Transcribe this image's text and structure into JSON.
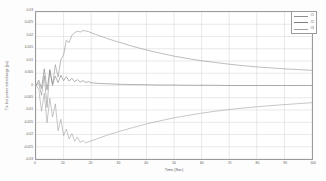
{
  "chart_data": {
    "type": "line",
    "title": "",
    "xlabel": "Time (Sec)",
    "ylabel": "Tie line power interchange (pu)",
    "xlim": [
      0,
      100
    ],
    "ylim": [
      -0.03,
      0.03
    ],
    "grid": true,
    "legend_position": "top-right",
    "xticks": [
      0,
      10,
      20,
      30,
      40,
      50,
      60,
      70,
      80,
      90,
      100
    ],
    "xtick_labels": [
      "0",
      "10",
      "20",
      "30",
      "40",
      "50",
      "60",
      "70",
      "80",
      "90",
      "100"
    ],
    "yticks": [
      -0.03,
      -0.025,
      -0.02,
      -0.015,
      -0.01,
      -0.005,
      0,
      0.005,
      0.01,
      0.015,
      0.02,
      0.025,
      0.03
    ],
    "ytick_labels": [
      "-0.03",
      "-0.025",
      "-0.02",
      "-0.015",
      "-0.01",
      "-0.005",
      "0",
      "0.005",
      "0.01",
      "0.015",
      "0.02",
      "0.025",
      "0.03"
    ],
    "x": [
      0,
      1,
      2,
      3,
      4,
      5,
      6,
      7,
      8,
      9,
      10,
      11,
      12,
      13,
      14,
      15,
      16,
      17,
      18,
      19,
      20,
      22,
      24,
      26,
      28,
      30,
      35,
      40,
      45,
      50,
      55,
      60,
      65,
      70,
      75,
      80,
      85,
      90,
      95,
      100
    ],
    "series": [
      {
        "name": "#1",
        "color": "#8f8f8f",
        "values": [
          0.0,
          0.001,
          -0.004,
          0.004,
          -0.009,
          0.0065,
          0.0,
          0.0085,
          0.0035,
          0.0105,
          0.0125,
          0.0185,
          0.0175,
          0.0205,
          0.0215,
          0.0222,
          0.0218,
          0.0224,
          0.0223,
          0.022,
          0.0215,
          0.0207,
          0.0199,
          0.0191,
          0.0184,
          0.0177,
          0.016,
          0.0145,
          0.0132,
          0.012,
          0.011,
          0.0101,
          0.0094,
          0.0087,
          0.0081,
          0.0076,
          0.0072,
          0.0068,
          0.0065,
          0.0062
        ]
      },
      {
        "name": "#2",
        "color": "#7d7d7d",
        "values": [
          0.0,
          0.0022,
          -0.0012,
          0.0068,
          -0.0018,
          0.0062,
          0.0005,
          0.0038,
          0.0012,
          0.0042,
          0.002,
          0.0036,
          0.0018,
          0.003,
          0.0016,
          0.0024,
          0.0014,
          0.002,
          0.0012,
          0.0016,
          0.0011,
          0.0009,
          0.0008,
          0.0007,
          0.0006,
          0.0005,
          0.0004,
          0.0003,
          0.0002,
          0.0002,
          0.0001,
          0.0001,
          0.0001,
          0.0,
          0.0,
          0.0,
          0.0,
          0.0,
          0.0,
          0.0
        ]
      },
      {
        "name": "#3",
        "color": "#a0a0a0",
        "values": [
          0.0,
          -0.0015,
          -0.0105,
          -0.0032,
          -0.0152,
          -0.0052,
          -0.0128,
          -0.0075,
          -0.0185,
          -0.0138,
          -0.0205,
          -0.0178,
          -0.0218,
          -0.0196,
          -0.0228,
          -0.021,
          -0.0232,
          -0.0225,
          -0.0234,
          -0.023,
          -0.0226,
          -0.0218,
          -0.021,
          -0.0202,
          -0.0195,
          -0.0188,
          -0.0172,
          -0.0157,
          -0.0144,
          -0.0132,
          -0.0122,
          -0.0113,
          -0.0105,
          -0.0098,
          -0.0092,
          -0.0087,
          -0.0082,
          -0.0078,
          -0.0074,
          -0.007
        ]
      }
    ]
  },
  "legend": {
    "items": [
      {
        "label": "#1"
      },
      {
        "label": "#2"
      },
      {
        "label": "#3"
      }
    ]
  }
}
